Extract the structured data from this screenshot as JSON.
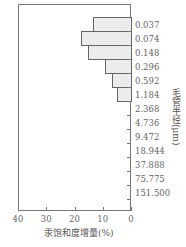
{
  "chart_data": {
    "type": "bar",
    "orientation": "horizontal",
    "title": "",
    "xlabel": "汞饱和度增量(%)",
    "ylabel": "毛管半径(μm)",
    "xlim": [
      40,
      0
    ],
    "x_ticks": [
      "40",
      "30",
      "20",
      "10",
      "0"
    ],
    "categories": [
      "0.037",
      "0.074",
      "0.148",
      "0.296",
      "0.592",
      "1.184",
      "2.368",
      "4.736",
      "9.472",
      "18.944",
      "37.888",
      "75.775",
      "151.500"
    ],
    "values": [
      13.4,
      17.7,
      15.2,
      9.2,
      6.7,
      4.9,
      0,
      0,
      0,
      0,
      0,
      0,
      0
    ],
    "grid": false,
    "legend": null
  }
}
